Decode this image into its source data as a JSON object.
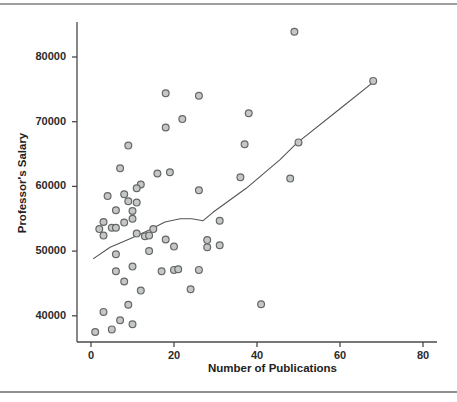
{
  "figure": {
    "background": "#ffffff",
    "top_rule_color": "#9e9e9e",
    "bottom_rule_color": "#8f8f8f"
  },
  "chart_data": {
    "type": "scatter",
    "title": "",
    "xlabel": "Number of Publications",
    "ylabel": "Professor's Salary",
    "x_ticks": [
      0,
      20,
      40,
      60,
      80
    ],
    "y_ticks": [
      40000,
      50000,
      60000,
      70000,
      80000
    ],
    "xlim": [
      -3.4,
      83.4
    ],
    "ylim": [
      35900,
      85400
    ],
    "grid": false,
    "legend": "none",
    "marker": {
      "shape": "circle",
      "fill": "#c3c7c7",
      "stroke": "#666666",
      "radius": 3.4,
      "stroke_width": 1.2
    },
    "axis_color": "#4a4a4a",
    "curve_color": "#555555",
    "points": [
      [
        49,
        83900
      ],
      [
        68,
        76300
      ],
      [
        18,
        74400
      ],
      [
        26,
        74000
      ],
      [
        38,
        71300
      ],
      [
        22,
        70400
      ],
      [
        18,
        69100
      ],
      [
        50,
        66800
      ],
      [
        37,
        66500
      ],
      [
        9,
        66300
      ],
      [
        7,
        62800
      ],
      [
        16,
        62000
      ],
      [
        19,
        62200
      ],
      [
        36,
        61400
      ],
      [
        48,
        61200
      ],
      [
        26,
        59400
      ],
      [
        12,
        60300
      ],
      [
        11,
        59700
      ],
      [
        4,
        58500
      ],
      [
        8,
        58800
      ],
      [
        9,
        57700
      ],
      [
        11,
        57500
      ],
      [
        6,
        56300
      ],
      [
        10,
        56200
      ],
      [
        10,
        55000
      ],
      [
        8,
        54400
      ],
      [
        3,
        54500
      ],
      [
        5,
        53600
      ],
      [
        6,
        53600
      ],
      [
        2,
        53400
      ],
      [
        3,
        52400
      ],
      [
        11,
        52700
      ],
      [
        13,
        52300
      ],
      [
        14,
        52400
      ],
      [
        15,
        53400
      ],
      [
        18,
        51800
      ],
      [
        20,
        50700
      ],
      [
        14,
        50000
      ],
      [
        31,
        54700
      ],
      [
        28,
        51700
      ],
      [
        31,
        50900
      ],
      [
        28,
        50600
      ],
      [
        6,
        49500
      ],
      [
        6,
        46900
      ],
      [
        10,
        47600
      ],
      [
        8,
        45300
      ],
      [
        12,
        43900
      ],
      [
        17,
        46900
      ],
      [
        20,
        47100
      ],
      [
        21,
        47200
      ],
      [
        26,
        47100
      ],
      [
        24,
        44100
      ],
      [
        41,
        41800
      ],
      [
        3,
        40600
      ],
      [
        9,
        41700
      ],
      [
        7,
        39300
      ],
      [
        10,
        38700
      ],
      [
        5,
        37900
      ],
      [
        1,
        37500
      ]
    ],
    "smooth_line": [
      [
        0.5,
        48800
      ],
      [
        4.6,
        50600
      ],
      [
        9.4,
        51900
      ],
      [
        14.2,
        53300
      ],
      [
        17.8,
        54500
      ],
      [
        21.5,
        55000
      ],
      [
        24.3,
        55000
      ],
      [
        27.0,
        54700
      ],
      [
        29.4,
        56000
      ],
      [
        37.4,
        59700
      ],
      [
        45.5,
        64100
      ],
      [
        49.6,
        66700
      ],
      [
        60.0,
        72000
      ],
      [
        68.4,
        76300
      ]
    ]
  }
}
